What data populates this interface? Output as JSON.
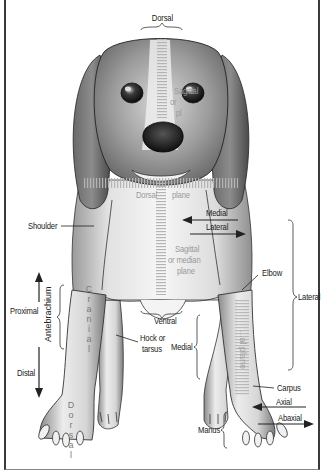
{
  "figure": {
    "type": "anatomical-diagram",
    "colors": {
      "ink": "#222222",
      "faint_label": "#9a9a9a",
      "frame": "#3a3a3a",
      "fur_dark": "#5a5a5a",
      "nose": "#1a1a1a"
    }
  },
  "labels": {
    "dorsal_top": "Dorsal",
    "sagittal_head_1": "Sagittal",
    "sagittal_head_2": "or",
    "sagittal_head_3": "pl",
    "dorsal_plane_left": "Dorsal",
    "dorsal_plane_right": "plane",
    "shoulder": "Shoulder",
    "medial_arrow": "Medial",
    "lateral_arrow": "Lateral",
    "sagittal_body_1": "Sagittal",
    "sagittal_body_2": "or median",
    "sagittal_body_3": "plane",
    "elbow": "Elbow",
    "lateral_brace": "Lateral",
    "proximal": "Proximal",
    "antebrachium": "Antebrachium",
    "distal": "Distal",
    "cranial_letters": [
      "C",
      "r",
      "a",
      "n",
      "i",
      "a",
      "l"
    ],
    "ventral": "Ventral",
    "hock_1": "Hock or",
    "hock_2": "tarsus",
    "medial_brace": "Medial",
    "transverse_plane": "...al plane",
    "carpus": "Carpus",
    "axial": "Axial",
    "abaxial": "Abaxial",
    "manus": "Manus",
    "dorsal_letters": [
      "D",
      "o",
      "r",
      "s",
      "a",
      "l"
    ]
  }
}
